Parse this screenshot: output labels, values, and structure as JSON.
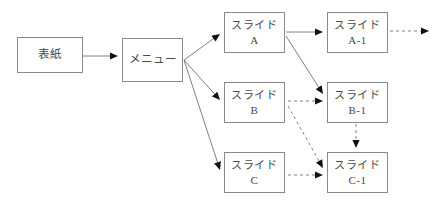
{
  "diagram": {
    "background_color": "#ffffff",
    "node_border_color": "#8a8a8a",
    "text_color": "#4a4a4a",
    "edge_color": "#808080",
    "nodes": [
      {
        "id": "cover",
        "line1": "表紙",
        "line2": "",
        "x": 17,
        "y": 37,
        "w": 66,
        "h": 36
      },
      {
        "id": "menu",
        "line1": "メニュー",
        "line2": "",
        "x": 122,
        "y": 38,
        "w": 61,
        "h": 44
      },
      {
        "id": "slide-a",
        "line1": "スライド",
        "line2": "A",
        "x": 224,
        "y": 12,
        "w": 61,
        "h": 41
      },
      {
        "id": "slide-a-1",
        "line1": "スライド",
        "line2": "A-1",
        "x": 327,
        "y": 12,
        "w": 61,
        "h": 41
      },
      {
        "id": "slide-b",
        "line1": "スライド",
        "line2": "B",
        "x": 224,
        "y": 82,
        "w": 61,
        "h": 41
      },
      {
        "id": "slide-b-1",
        "line1": "スライド",
        "line2": "B-1",
        "x": 327,
        "y": 82,
        "w": 61,
        "h": 41
      },
      {
        "id": "slide-c",
        "line1": "スライド",
        "line2": "C",
        "x": 224,
        "y": 152,
        "w": 61,
        "h": 41
      },
      {
        "id": "slide-c-1",
        "line1": "スライド",
        "line2": "C-1",
        "x": 327,
        "y": 152,
        "w": 61,
        "h": 41
      }
    ],
    "edges": [
      {
        "id": "cover-to-menu",
        "from": "cover",
        "to": "menu",
        "style": "solid",
        "x1": 83,
        "y1": 56,
        "x2": 118,
        "y2": 56
      },
      {
        "id": "menu-to-slide-a",
        "from": "menu",
        "to": "slide-a",
        "style": "solid",
        "x1": 184,
        "y1": 60,
        "x2": 220,
        "y2": 34
      },
      {
        "id": "menu-to-slide-b",
        "from": "menu",
        "to": "slide-b",
        "style": "solid",
        "x1": 184,
        "y1": 60,
        "x2": 220,
        "y2": 100
      },
      {
        "id": "menu-to-slide-c",
        "from": "menu",
        "to": "slide-c",
        "style": "solid",
        "x1": 184,
        "y1": 60,
        "x2": 220,
        "y2": 170
      },
      {
        "id": "slide-a-to-a-1",
        "from": "slide-a",
        "to": "slide-a-1",
        "style": "solid",
        "x1": 286,
        "y1": 32,
        "x2": 323,
        "y2": 32
      },
      {
        "id": "slide-a-to-b-1",
        "from": "slide-a",
        "to": "slide-b-1",
        "style": "solid",
        "x1": 286,
        "y1": 36,
        "x2": 323,
        "y2": 94
      },
      {
        "id": "slide-a-1-to-next",
        "from": "slide-a-1",
        "to": "",
        "style": "dashed",
        "x1": 390,
        "y1": 31,
        "x2": 429,
        "y2": 31
      },
      {
        "id": "slide-b-to-b-1",
        "from": "slide-b",
        "to": "slide-b-1",
        "style": "dashed",
        "x1": 288,
        "y1": 101,
        "x2": 323,
        "y2": 101
      },
      {
        "id": "slide-b-to-c-1",
        "from": "slide-b",
        "to": "slide-c-1",
        "style": "dashed",
        "x1": 288,
        "y1": 106,
        "x2": 323,
        "y2": 168
      },
      {
        "id": "slide-b-1-to-c-1",
        "from": "slide-b-1",
        "to": "slide-c-1",
        "style": "dashed",
        "x1": 356,
        "y1": 124,
        "x2": 356,
        "y2": 148
      },
      {
        "id": "slide-c-to-c-1",
        "from": "slide-c",
        "to": "slide-c-1",
        "style": "dashed",
        "x1": 288,
        "y1": 175,
        "x2": 323,
        "y2": 175
      }
    ]
  }
}
